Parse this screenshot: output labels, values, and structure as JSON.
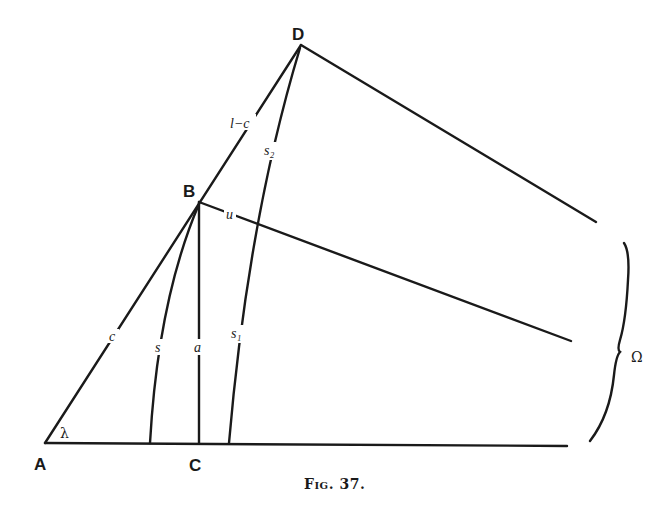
{
  "figure": {
    "caption": "Fig. 37.",
    "points": {
      "A": "A",
      "B": "B",
      "C": "C",
      "D": "D"
    },
    "segment_labels": {
      "c": "c",
      "l_minus_c": "l−c",
      "s": "s",
      "a": "a",
      "s1": "s₁",
      "s2": "s₂",
      "u": "u"
    },
    "angle_label": "λ",
    "brace_label": "Ω",
    "colors": {
      "ink": "#1a1a1a",
      "background": "#ffffff"
    }
  }
}
